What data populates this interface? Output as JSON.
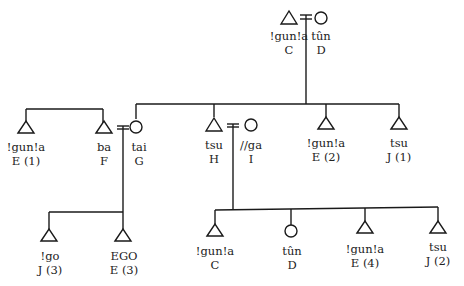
{
  "people": [
    {
      "id": "C_top",
      "sex": "male",
      "term": "!gun!a",
      "letter": "C"
    },
    {
      "id": "D_top",
      "sex": "female",
      "term": "tûn",
      "letter": "D"
    },
    {
      "id": "E1",
      "sex": "male",
      "term": "!gun!a",
      "letter": "E (1)"
    },
    {
      "id": "F",
      "sex": "male",
      "term": "ba",
      "letter": "F"
    },
    {
      "id": "G",
      "sex": "female",
      "term": "tai",
      "letter": "G"
    },
    {
      "id": "H",
      "sex": "male",
      "term": "tsu",
      "letter": "H"
    },
    {
      "id": "I",
      "sex": "female",
      "term": "//ga",
      "letter": "I"
    },
    {
      "id": "E2",
      "sex": "male",
      "term": "!gun!a",
      "letter": "E (2)"
    },
    {
      "id": "J1",
      "sex": "male",
      "term": "tsu",
      "letter": "J (1)"
    },
    {
      "id": "J3",
      "sex": "male",
      "term": "!go",
      "letter": "J (3)"
    },
    {
      "id": "EGO",
      "sex": "male",
      "term": "EGO",
      "letter": "E (3)"
    },
    {
      "id": "C_bot",
      "sex": "male",
      "term": "!gun!a",
      "letter": "C"
    },
    {
      "id": "D_bot",
      "sex": "female",
      "term": "tûn",
      "letter": "D"
    },
    {
      "id": "E4",
      "sex": "male",
      "term": "!gun!a",
      "letter": "E (4)"
    },
    {
      "id": "J2",
      "sex": "male",
      "term": "tsu",
      "letter": "J (2)"
    }
  ],
  "marriages": [
    [
      "C_top",
      "D_top"
    ],
    [
      "F",
      "G"
    ],
    [
      "H",
      "I"
    ]
  ],
  "sibling_groups": [
    {
      "parents": [
        "C_top",
        "D_top"
      ],
      "children": [
        "G",
        "H",
        "E2",
        "J1"
      ]
    },
    {
      "parents": [
        "F",
        "G"
      ],
      "children": [
        "J3",
        "EGO"
      ]
    },
    {
      "parents": [
        "H",
        "I"
      ],
      "children": [
        "C_bot",
        "D_bot",
        "E4",
        "J2"
      ]
    }
  ],
  "unrelated_lines": [
    {
      "members": [
        "E1",
        "F"
      ]
    }
  ]
}
